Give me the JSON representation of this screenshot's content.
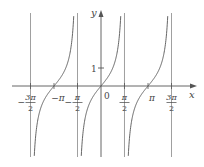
{
  "figure": {
    "function": "y = tan x",
    "axes": {
      "x_label": "x",
      "y_label": "y",
      "origin_label": "0",
      "y_tick_label": "1"
    },
    "x_ticks": [
      {
        "id": "neg-3pi-2",
        "value": -4.712389,
        "label_num": "3π",
        "label_den": "2",
        "sign": "−",
        "fraction": true
      },
      {
        "id": "neg-pi",
        "value": -3.141593,
        "label": "−π",
        "fraction": false
      },
      {
        "id": "neg-pi-2",
        "value": -1.570796,
        "label_num": "π",
        "label_den": "2",
        "sign": "−",
        "fraction": true
      },
      {
        "id": "pi-2",
        "value": 1.570796,
        "label_num": "π",
        "label_den": "2",
        "sign": "",
        "fraction": true
      },
      {
        "id": "pi",
        "value": 3.141593,
        "label": "π",
        "fraction": false
      },
      {
        "id": "3pi-2",
        "value": 4.712389,
        "label_num": "3π",
        "label_den": "2",
        "sign": "",
        "fraction": true
      }
    ],
    "asymptotes": [
      -4.712389,
      -1.570796,
      1.570796,
      4.712389
    ],
    "colors": {
      "curve": "#555555",
      "axis": "#555555",
      "asymptote": "#888888"
    }
  },
  "chart_data": {
    "type": "line",
    "title": "",
    "xlabel": "x",
    "ylabel": "y",
    "series": [
      {
        "name": "tan x (branch centered at −π)",
        "domain": [
          -4.712389,
          -1.570796
        ]
      },
      {
        "name": "tan x (branch centered at 0)",
        "domain": [
          -1.570796,
          1.570796
        ]
      },
      {
        "name": "tan x (branch centered at π)",
        "domain": [
          1.570796,
          4.712389
        ]
      }
    ],
    "x_ticks": [
      "−3π/2",
      "−π",
      "−π/2",
      "0",
      "π/2",
      "π",
      "3π/2"
    ],
    "y_ticks": [
      "1"
    ],
    "vertical_asymptotes": [
      "−3π/2",
      "−π/2",
      "π/2",
      "3π/2"
    ],
    "xlim": [
      -5.7,
      5.9
    ],
    "ylim": [
      -3.9,
      4.2
    ],
    "grid": false,
    "legend": "none"
  }
}
